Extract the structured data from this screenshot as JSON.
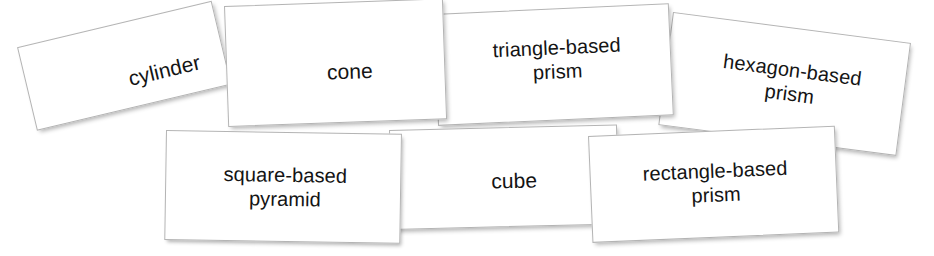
{
  "board": {
    "title": "3D shape name cards",
    "background_color": "#ffffff",
    "card_face_color": "#ffffff",
    "card_border_color": "#b4b4b4",
    "text_color": "#141414"
  },
  "cards": [
    {
      "id": "cylinder",
      "label": "cylinder",
      "rotation_deg": -13.4
    },
    {
      "id": "cone",
      "label": "cone",
      "rotation_deg": -2.0
    },
    {
      "id": "triangle-prism",
      "label": "triangle-based\nprism",
      "rotation_deg": -2.6
    },
    {
      "id": "hexagon-prism",
      "label": "hexagon-based\nprism",
      "rotation_deg": 7.4
    },
    {
      "id": "square-pyramid",
      "label": "square-based\npyramid",
      "rotation_deg": 0.9
    },
    {
      "id": "cube",
      "label": "cube",
      "rotation_deg": -1.4
    },
    {
      "id": "rectangle-prism",
      "label": "rectangle-based\nprism",
      "rotation_deg": -2.4
    }
  ]
}
